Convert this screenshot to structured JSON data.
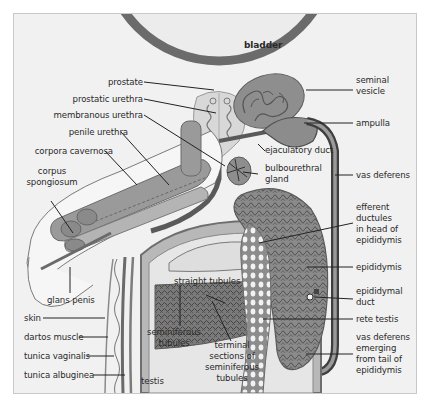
{
  "diagram": {
    "colors": {
      "background": "#f1f1f1",
      "frame_border": "#c9c9c9",
      "tissue_dark": "#6e6e6e",
      "tissue_mid": "#8f8f8f",
      "tissue_light": "#cfcfcf",
      "tissue_pale": "#e3e3e3",
      "duct": "#4a4a4a",
      "leader_line": "#222222",
      "text": "#2a2a2a"
    }
  },
  "labels": {
    "bladder": "bladder",
    "prostate": "prostate",
    "prostatic_urethra": "prostatic urethra",
    "membranous_urethra": "membranous urethra",
    "penile_urethra": "penile urethra",
    "corpora_cavernosa": "corpora cavernosa",
    "corpus_spongiosum": "corpus\nspongiosum",
    "glans_penis": "glans penis",
    "skin": "skin",
    "dartos_muscle": "dartos muscle",
    "tunica_vaginalis": "tunica vaginalis",
    "tunica_albuginea": "tunica albuginea",
    "testis": "testis",
    "seminiferous_tubules": "seminiferous\ntubules",
    "straight_tubules": "straight tubules",
    "terminal_sections": "terminal\nsections of\nseminiferous\ntubules",
    "seminal_vesicle": "seminal\nvesicle",
    "ampulla": "ampulla",
    "ejaculatory_duct": "ejaculatory duct",
    "bulbourethral_gland": "bulbourethral\ngland",
    "vas_deferens": "vas deferens",
    "efferent_ductules": "efferent\nductules\nin head of\nepididymis",
    "epididymis": "epididymis",
    "epididymal_duct": "epididymal\nduct",
    "rete_testis": "rete testis",
    "vas_deferens_emerging": "vas deferens\nemerging\nfrom tail of\nepididymis"
  }
}
